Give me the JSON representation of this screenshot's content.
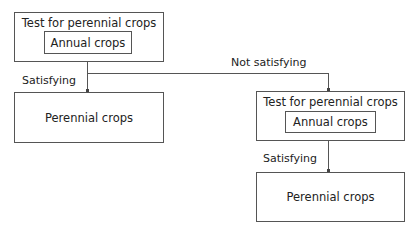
{
  "diagram": {
    "type": "flowchart",
    "nodes": {
      "test1": {
        "title": "Test for perennial crops",
        "inner": "Annual crops"
      },
      "result1": {
        "label": "Perennial crops"
      },
      "test2": {
        "title": "Test for perennial crops",
        "inner": "Annual crops"
      },
      "result2": {
        "label": "Perennial crops"
      }
    },
    "edges": {
      "test1_to_result1": "Satisfying",
      "test1_to_test2": "Not satisfying",
      "test2_to_result2": "Satisfying"
    },
    "colors": {
      "line": "#555555",
      "text": "#222222",
      "background": "#ffffff"
    }
  }
}
